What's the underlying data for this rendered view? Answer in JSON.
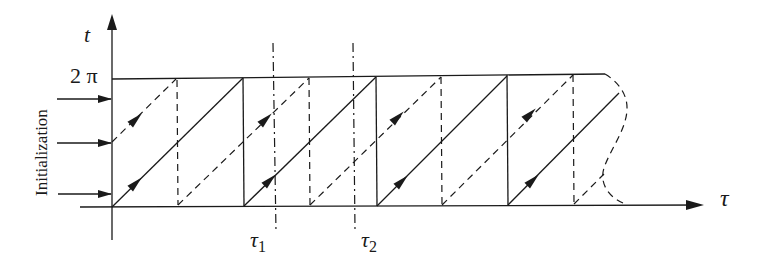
{
  "diagram": {
    "y_axis_label": "t",
    "x_axis_label": "τ",
    "top_level_label": "2 π",
    "side_label": "Initialization",
    "markers": [
      {
        "label": "τ",
        "subscript": "1"
      },
      {
        "label": "τ",
        "subscript": "2"
      }
    ],
    "init_arrows": 3,
    "cells": 4,
    "colors": {
      "ink": "#1a1a1a",
      "background": "#ffffff"
    }
  }
}
